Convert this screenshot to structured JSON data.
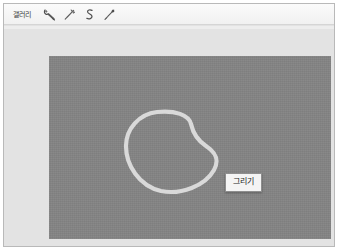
{
  "window": {
    "background_color": "#e3e3e3",
    "border_color": "#b9b9b9"
  },
  "toolbar": {
    "gallery_label": "갤러리",
    "background_color": "#f5f5f5",
    "tools": [
      {
        "name": "wrench-icon",
        "label": "wrench"
      },
      {
        "name": "magic-wand-icon",
        "label": "magic wand"
      },
      {
        "name": "curve-tool-icon",
        "label": "curve"
      },
      {
        "name": "brush-icon",
        "label": "brush"
      }
    ]
  },
  "canvas": {
    "background_color": "#848484",
    "stroke_color": "#d9d9d9",
    "shape": "hand-drawn closed loop"
  },
  "tooltip": {
    "text": "그리기",
    "background_color": "#f4f4f4",
    "border_color": "#8e8e8e"
  }
}
